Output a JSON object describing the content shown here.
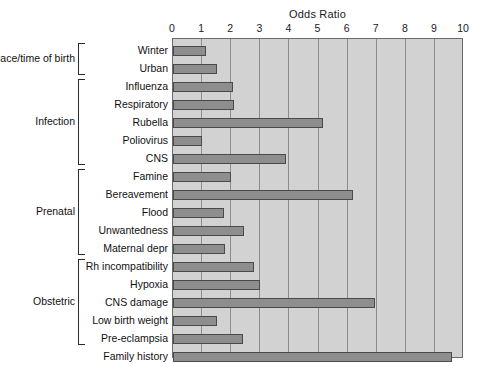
{
  "chart_data": {
    "type": "bar",
    "orientation": "horizontal",
    "title": "Odds Ratio",
    "xlabel": "",
    "ylabel": "",
    "xlim": [
      0,
      10
    ],
    "xticks": [
      "0",
      "1",
      "2",
      "3",
      "4",
      "5",
      "6",
      "7",
      "8",
      "9",
      "10"
    ],
    "grid": true,
    "legend": "none",
    "colors": {
      "plot_background": "#d2d2d2",
      "bar_fill": "#8e8e8e",
      "bar_border": "#4a4a4a",
      "gridline": "#8d8d8d",
      "axis_border": "#6a6a6a",
      "text": "#111111"
    },
    "categories": [
      "Winter",
      "Urban",
      "Influenza",
      "Respiratory",
      "Rubella",
      "Poliovirus",
      "CNS",
      "Famine",
      "Bereavement",
      "Flood",
      "Unwantedness",
      "Maternal depr",
      "Rh incompatibility",
      "Hypoxia",
      "CNS damage",
      "Low birth weight",
      "Pre-eclampsia",
      "Family history"
    ],
    "values": [
      1.15,
      1.5,
      2.05,
      2.1,
      5.15,
      1.0,
      3.9,
      2.0,
      6.2,
      1.75,
      2.45,
      1.8,
      2.8,
      3.0,
      6.95,
      1.5,
      2.4,
      9.6
    ],
    "groups": [
      {
        "label": "Place/time of birth",
        "start": 0,
        "end": 1
      },
      {
        "label": "Infection",
        "start": 2,
        "end": 6
      },
      {
        "label": "Prenatal",
        "start": 7,
        "end": 11
      },
      {
        "label": "Obstetric",
        "start": 12,
        "end": 16
      }
    ]
  }
}
